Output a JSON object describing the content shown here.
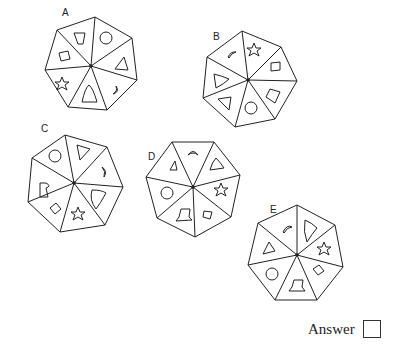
{
  "question": {
    "options": [
      {
        "label": "A",
        "segments_clockwise_from_top": [
          "circle",
          "triangle",
          "crescent",
          "bell-arch",
          "star",
          "square",
          "trapezoid"
        ]
      },
      {
        "label": "B",
        "segments_clockwise_from_top": [
          "star",
          "square",
          "trapezoid",
          "circle",
          "triangle",
          "bell-arch",
          "crescent"
        ]
      },
      {
        "label": "C",
        "segments_clockwise_from_top": [
          "triangle",
          "crescent",
          "bell-arch",
          "star",
          "square",
          "trapezoid",
          "circle"
        ]
      },
      {
        "label": "D",
        "segments_clockwise_from_top": [
          "crescent",
          "bell-arch",
          "star",
          "square",
          "trapezoid",
          "circle",
          "triangle"
        ]
      },
      {
        "label": "E",
        "segments_clockwise_from_top": [
          "bell-arch",
          "star",
          "square",
          "trapezoid",
          "circle",
          "triangle",
          "crescent"
        ]
      }
    ]
  },
  "labels": {
    "A": "A",
    "B": "B",
    "C": "C",
    "D": "D",
    "E": "E"
  },
  "answer": {
    "label": "Answer",
    "value": ""
  }
}
